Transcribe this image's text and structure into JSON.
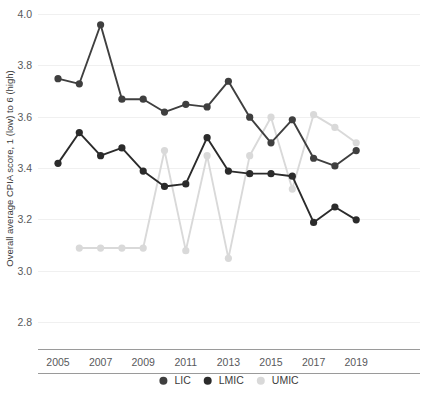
{
  "chart_data": {
    "type": "line",
    "title": "",
    "subtitle": "",
    "xlabel": "",
    "ylabel": "Overall average CPIA score, 1 (low) to 6 (high)",
    "x": [
      2005,
      2006,
      2007,
      2008,
      2009,
      2010,
      2011,
      2012,
      2013,
      2014,
      2015,
      2016,
      2017,
      2018,
      2019
    ],
    "categories": [
      "2005",
      "2006",
      "2007",
      "2008",
      "2009",
      "2010",
      "2011",
      "2012",
      "2013",
      "2014",
      "2015",
      "2016",
      "2017",
      "2018",
      "2019"
    ],
    "x_tick_labels": [
      "2005",
      "2007",
      "2009",
      "2011",
      "2013",
      "2015",
      "2017",
      "2019"
    ],
    "x_tick_values": [
      2005,
      2007,
      2009,
      2011,
      2013,
      2015,
      2017,
      2019
    ],
    "y_tick_labels": [
      "2.8",
      "3.0",
      "3.2",
      "3.4",
      "3.6",
      "3.8",
      "4.0"
    ],
    "y_tick_values": [
      2.8,
      3.0,
      3.2,
      3.4,
      3.6,
      3.8,
      4.0
    ],
    "ylim": [
      2.72,
      4.02
    ],
    "xlim": [
      2004.4,
      2019.6
    ],
    "grid": true,
    "legend_position": "bottom",
    "series": [
      {
        "name": "LIC",
        "color": "#3f3f3f",
        "x": [
          2005,
          2006,
          2007,
          2008,
          2009,
          2010,
          2011,
          2012,
          2013,
          2014,
          2015,
          2016,
          2017,
          2018,
          2019
        ],
        "values": [
          3.75,
          3.73,
          3.96,
          3.67,
          3.67,
          3.62,
          3.65,
          3.64,
          3.74,
          3.6,
          3.5,
          3.59,
          3.44,
          3.41,
          3.47
        ]
      },
      {
        "name": "LMIC",
        "color": "#2b2b2b",
        "x": [
          2005,
          2006,
          2007,
          2008,
          2009,
          2010,
          2011,
          2012,
          2013,
          2014,
          2015,
          2016,
          2017,
          2018,
          2019
        ],
        "values": [
          3.42,
          3.54,
          3.45,
          3.48,
          3.39,
          3.33,
          3.34,
          3.52,
          3.39,
          3.38,
          3.38,
          3.37,
          3.19,
          3.25,
          3.2
        ]
      },
      {
        "name": "UMIC",
        "color": "#d9d9d9",
        "x": [
          2006,
          2007,
          2008,
          2009,
          2010,
          2011,
          2012,
          2013,
          2014,
          2015,
          2016,
          2017,
          2018,
          2019
        ],
        "values": [
          3.09,
          3.09,
          3.09,
          3.09,
          3.47,
          3.08,
          3.45,
          3.05,
          3.45,
          3.6,
          3.32,
          3.61,
          3.56,
          3.5
        ]
      }
    ]
  },
  "legend": {
    "items": [
      {
        "label": "LIC",
        "color": "#3f3f3f"
      },
      {
        "label": "LMIC",
        "color": "#2b2b2b"
      },
      {
        "label": "UMIC",
        "color": "#d9d9d9"
      }
    ]
  }
}
